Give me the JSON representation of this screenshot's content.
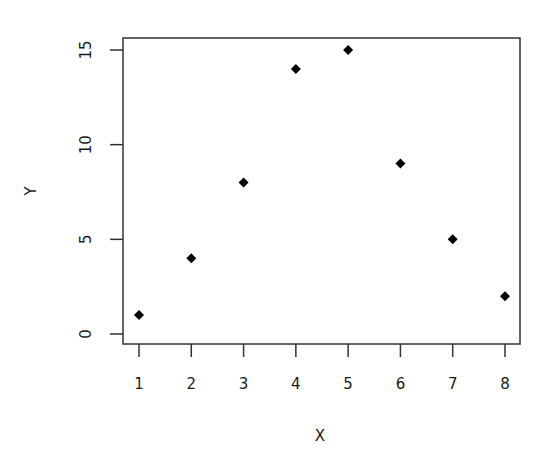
{
  "chart_data": {
    "type": "scatter",
    "title": "",
    "xlabel": "X",
    "ylabel": "Y",
    "x": [
      1,
      2,
      3,
      4,
      5,
      6,
      7,
      8
    ],
    "series": [
      {
        "name": "Y",
        "values": [
          1,
          4,
          8,
          14,
          15,
          9,
          5,
          2
        ]
      }
    ],
    "xticks": [
      1,
      2,
      3,
      4,
      5,
      6,
      7,
      8
    ],
    "yticks": [
      0,
      5,
      10,
      15
    ],
    "xlim": [
      0.7,
      8.3
    ],
    "ylim": [
      -0.5,
      15.6
    ],
    "grid": false,
    "legend": null,
    "marker": "filled-diamond",
    "marker_color": "#000000",
    "axis_color": "#333333"
  }
}
